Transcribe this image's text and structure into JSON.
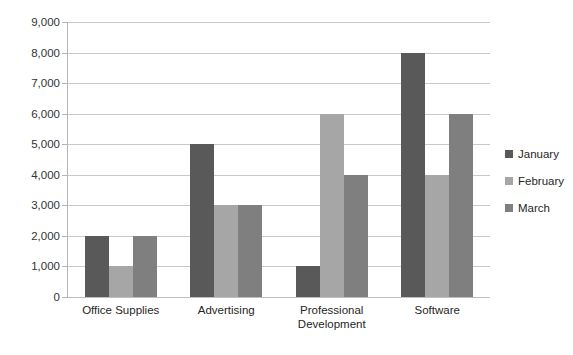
{
  "chart_data": {
    "type": "bar",
    "title": "",
    "subtitle": "",
    "xlabel": "",
    "ylabel": "",
    "categories": [
      "Office Supplies",
      "Advertising",
      "Professional Development",
      "Software"
    ],
    "series": [
      {
        "name": "January",
        "color": "#595959",
        "values": [
          2000,
          5000,
          1000,
          8000
        ]
      },
      {
        "name": "February",
        "color": "#a6a6a6",
        "values": [
          1000,
          3000,
          6000,
          4000
        ]
      },
      {
        "name": "March",
        "color": "#7f7f7f",
        "values": [
          2000,
          3000,
          4000,
          6000
        ]
      }
    ],
    "ylim": [
      0,
      9000
    ],
    "ytick_step": 1000,
    "ytick_labels": [
      "0",
      "1,000",
      "2,000",
      "3,000",
      "4,000",
      "5,000",
      "6,000",
      "7,000",
      "8,000",
      "9,000"
    ],
    "grid": "horizontal",
    "legend_position": "right",
    "annotations": []
  },
  "legend": {
    "items": [
      {
        "label": "January"
      },
      {
        "label": "February"
      },
      {
        "label": "March"
      }
    ]
  },
  "axis": {
    "y_labels": [
      "9,000",
      "8,000",
      "7,000",
      "6,000",
      "5,000",
      "4,000",
      "3,000",
      "2,000",
      "1,000",
      "0"
    ],
    "x_labels": [
      "Office Supplies",
      "Advertising",
      "Professional\nDevelopment",
      "Software"
    ]
  }
}
